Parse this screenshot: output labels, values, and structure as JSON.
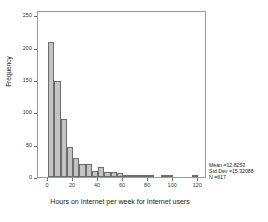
{
  "chart_data": {
    "type": "bar",
    "title": "",
    "subtitle": "",
    "xlabel": "Hours on Internet per week for Internet users",
    "ylabel": "Frequency",
    "xlim": [
      -8,
      127
    ],
    "ylim": [
      0,
      258
    ],
    "grid": false,
    "legend": null,
    "bin_width": 5,
    "x_ticks": [
      0,
      20,
      40,
      60,
      80,
      100,
      120
    ],
    "y_ticks": [
      0,
      50,
      100,
      150,
      200,
      250
    ],
    "bars": [
      {
        "bin_start": 0,
        "bin_end": 5,
        "center": 2.5,
        "value": 208
      },
      {
        "bin_start": 5,
        "bin_end": 10,
        "center": 7.5,
        "value": 148
      },
      {
        "bin_start": 10,
        "bin_end": 15,
        "center": 12.5,
        "value": 89
      },
      {
        "bin_start": 15,
        "bin_end": 20,
        "center": 17.5,
        "value": 47
      },
      {
        "bin_start": 20,
        "bin_end": 25,
        "center": 22.5,
        "value": 29
      },
      {
        "bin_start": 25,
        "bin_end": 30,
        "center": 27.5,
        "value": 20
      },
      {
        "bin_start": 30,
        "bin_end": 35,
        "center": 32.5,
        "value": 20
      },
      {
        "bin_start": 35,
        "bin_end": 40,
        "center": 37.5,
        "value": 9
      },
      {
        "bin_start": 40,
        "bin_end": 45,
        "center": 42.5,
        "value": 15
      },
      {
        "bin_start": 45,
        "bin_end": 50,
        "center": 47.5,
        "value": 7
      },
      {
        "bin_start": 50,
        "bin_end": 55,
        "center": 52.5,
        "value": 8
      },
      {
        "bin_start": 55,
        "bin_end": 60,
        "center": 57.5,
        "value": 6
      },
      {
        "bin_start": 60,
        "bin_end": 65,
        "center": 62.5,
        "value": 2
      },
      {
        "bin_start": 65,
        "bin_end": 70,
        "center": 67.5,
        "value": 2
      },
      {
        "bin_start": 70,
        "bin_end": 75,
        "center": 72.5,
        "value": 3
      },
      {
        "bin_start": 75,
        "bin_end": 80,
        "center": 77.5,
        "value": 2
      },
      {
        "bin_start": 80,
        "bin_end": 85,
        "center": 82.5,
        "value": 1
      },
      {
        "bin_start": 90,
        "bin_end": 95,
        "center": 92.5,
        "value": 2
      },
      {
        "bin_start": 95,
        "bin_end": 100,
        "center": 97.5,
        "value": 1
      },
      {
        "bin_start": 115,
        "bin_end": 120,
        "center": 117.5,
        "value": 1
      }
    ],
    "annotations": {
      "mean_label": "Mean =12.8253",
      "std_dev_label": "Std  Dev  =15.32088",
      "n_label": "N =617",
      "mean_value": 12.8253,
      "std_dev_value": 15.32088,
      "n_value": 617
    }
  },
  "colors": {
    "bar_fill": "#c3c3c3",
    "bar_stroke": "#6d6d6d",
    "frame": "#9a9a9a",
    "text": "#222222",
    "background": "#ffffff"
  }
}
